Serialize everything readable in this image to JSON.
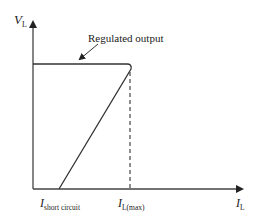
{
  "diagram": {
    "type": "foldback-current-limiting-characteristic",
    "y_axis": {
      "symbol": "V",
      "subscript": "L"
    },
    "x_axis": {
      "symbol": "I",
      "subscript": "L"
    },
    "annotation": "Regulated output",
    "x_markers": [
      {
        "symbol": "I",
        "subscript": "short circuit"
      },
      {
        "symbol": "I",
        "subscript": "L(max)"
      }
    ],
    "colors": {
      "line": "#333333",
      "background": "#ffffff"
    }
  }
}
